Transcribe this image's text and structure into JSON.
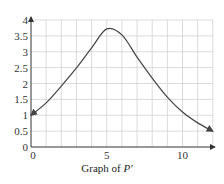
{
  "chart_data": {
    "type": "line",
    "title": "",
    "caption": "Graph of ",
    "caption_var": "P′",
    "xlabel": "",
    "ylabel": "",
    "xlim": [
      0,
      12
    ],
    "ylim": [
      0,
      4
    ],
    "grid": true,
    "x_ticks": [
      0,
      5,
      10
    ],
    "x_tick_labels": [
      "0",
      "5",
      "10"
    ],
    "y_ticks": [
      0,
      0.5,
      1,
      1.5,
      2,
      2.5,
      3,
      3.5,
      4
    ],
    "y_tick_labels": [
      "0",
      "0.5",
      "1",
      "1.5",
      "2",
      "2.5",
      "3",
      "3.5",
      "4"
    ],
    "series": [
      {
        "name": "P′",
        "x": [
          0,
          1,
          2,
          3,
          4,
          5,
          6,
          7,
          8,
          9,
          10,
          11,
          12
        ],
        "y": [
          1.0,
          1.39,
          1.92,
          2.49,
          3.12,
          3.72,
          3.53,
          2.83,
          2.17,
          1.57,
          1.1,
          0.76,
          0.5
        ]
      }
    ],
    "colors": {
      "line": "#444444",
      "grid": "#cccccc",
      "axis": "#333333"
    }
  }
}
